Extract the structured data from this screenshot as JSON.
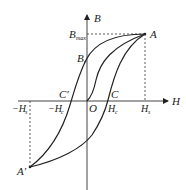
{
  "diagram": {
    "type": "hysteresis-loop",
    "axes": {
      "x_label": "H",
      "y_label": "B"
    },
    "points": {
      "A": "A",
      "A_prime": "A′",
      "B_r": "B",
      "B_r_sub": "r",
      "B_max": "B",
      "B_max_sub": "max",
      "C": "C",
      "C_prime": "C′",
      "O": "O"
    },
    "ticks": {
      "H_s": "H",
      "H_s_sub": "s",
      "neg_H_s": "−H",
      "neg_H_s_sub": "s",
      "H_c": "H",
      "H_c_sub": "c",
      "neg_H_c": "−H",
      "neg_H_c_sub": "c"
    },
    "colors": {
      "stroke": "#222222",
      "background": "#ffffff"
    }
  }
}
